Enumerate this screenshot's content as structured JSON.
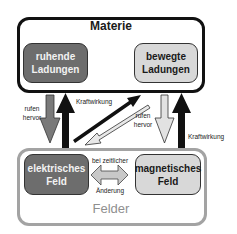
{
  "diagram": {
    "matter_group": {
      "title": "Materie",
      "resting_charges": {
        "line1": "ruhende",
        "line2": "Ladungen",
        "fill": "#6d6d6d"
      },
      "moving_charges": {
        "line1": "bewegte",
        "line2": "Ladungen",
        "fill": "#d8d8d8"
      },
      "border_color": "#111111"
    },
    "fields_group": {
      "title": "Felder",
      "electric_field": {
        "line1": "elektrisches",
        "line2": "Feld",
        "fill": "#6d6d6d"
      },
      "magnetic_field": {
        "line1": "magnetisches",
        "line2": "Feld",
        "fill": "#d8d8d8"
      },
      "border_color": "#a3a3a3"
    },
    "edges": [
      {
        "from": "ruhende Ladungen",
        "to": "elektrisches Feld",
        "label_line1": "rufen",
        "label_line2": "hervor",
        "style": "dark-gray"
      },
      {
        "from": "elektrisches Feld",
        "to": "ruhende Ladungen",
        "label": "Kraftwirkung",
        "style": "black"
      },
      {
        "from": "elektrisches Feld",
        "to": "bewegte Ladungen",
        "style": "black"
      },
      {
        "from": "bewegte Ladungen",
        "to": "elektrisches Feld",
        "label_line1": "rufen",
        "label_line2": "hervor",
        "style": "light-outline"
      },
      {
        "from": "bewegte Ladungen",
        "to": "magnetisches Feld",
        "style": "light-gray"
      },
      {
        "from": "magnetisches Feld",
        "to": "bewegte Ladungen",
        "label": "Kraftwirkung",
        "style": "black"
      },
      {
        "between": [
          "elektrisches Feld",
          "magnetisches Feld"
        ],
        "label_line1": "bei zeitlicher",
        "label_line2": "Änderung",
        "style": "double-headed-gray"
      }
    ]
  }
}
